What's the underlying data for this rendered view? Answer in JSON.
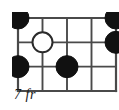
{
  "diagram": {
    "type": "guitar-chord-diagram",
    "title": "",
    "fret_label": "7 fr",
    "strings": 5,
    "frets": 3,
    "geometry": {
      "board_x": 12,
      "board_y": 12,
      "board_width": 98,
      "board_height": 73,
      "string_spacing": 24.5,
      "fret_spacing": 24.33
    },
    "colors": {
      "line": "#4a4a4a",
      "border": "#2b2b2b",
      "dot_fill": "#111111",
      "dot_stroke": "#111111",
      "open_fill": "#ffffff",
      "open_stroke": "#2b2b2b",
      "text": "#1a1a1a",
      "background": "#ffffff"
    },
    "string_positions": [
      0,
      24.5,
      49,
      73.5,
      98
    ],
    "fret_positions": [
      0,
      24.33,
      48.66,
      73
    ],
    "markers": [
      {
        "id": "marker-1",
        "label": "",
        "string": 0,
        "fret_line": 0,
        "cx": 0,
        "cy": 0,
        "r": 11,
        "style": "filled",
        "kind": "finger-dot"
      },
      {
        "id": "marker-2",
        "label": "",
        "string": 4,
        "fret_line": 0,
        "cx": 98,
        "cy": 0,
        "r": 11,
        "style": "filled",
        "kind": "finger-dot"
      },
      {
        "id": "marker-3",
        "label": "",
        "string": 4,
        "fret_line": 1,
        "cx": 98,
        "cy": 24.33,
        "r": 11,
        "style": "filled",
        "kind": "finger-dot"
      },
      {
        "id": "marker-4",
        "label": "",
        "string": 1,
        "fret_line": 1,
        "cx": 24.5,
        "cy": 24.33,
        "r": 10,
        "style": "open",
        "kind": "open-circle"
      },
      {
        "id": "marker-5",
        "label": "",
        "string": 0,
        "fret_line": 2,
        "cx": 0,
        "cy": 48.66,
        "r": 11,
        "style": "filled",
        "kind": "finger-dot"
      },
      {
        "id": "marker-6",
        "label": "",
        "string": 2,
        "fret_line": 2,
        "cx": 49,
        "cy": 48.66,
        "r": 11,
        "style": "filled",
        "kind": "finger-dot"
      }
    ]
  }
}
